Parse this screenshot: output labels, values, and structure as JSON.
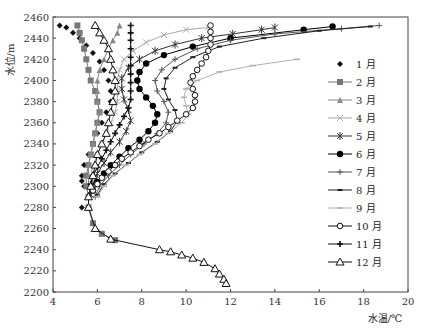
{
  "chart_data": {
    "type": "line",
    "title": "",
    "xlabel": "水温/℃",
    "ylabel": "水位/m",
    "xlim": [
      4,
      20
    ],
    "ylim": [
      2200,
      2460
    ],
    "xticks": [
      4,
      6,
      8,
      10,
      12,
      14,
      16,
      18,
      20
    ],
    "yticks": [
      2200,
      2220,
      2240,
      2260,
      2280,
      2300,
      2320,
      2340,
      2360,
      2380,
      2400,
      2420,
      2440,
      2460
    ],
    "grid": false,
    "legend_position": "right-inside",
    "series": [
      {
        "name": "1 月",
        "marker": "diamond-filled",
        "color": "#111111",
        "line": false,
        "points": [
          [
            4.3,
            2452
          ],
          [
            4.6,
            2450
          ],
          [
            4.9,
            2445
          ],
          [
            5.2,
            2440
          ],
          [
            5.5,
            2433
          ],
          [
            5.8,
            2426
          ],
          [
            6.1,
            2418
          ],
          [
            6.3,
            2410
          ],
          [
            6.5,
            2400
          ],
          [
            6.6,
            2390
          ],
          [
            6.6,
            2380
          ],
          [
            6.4,
            2370
          ],
          [
            6.2,
            2360
          ],
          [
            6.0,
            2350
          ],
          [
            5.8,
            2340
          ],
          [
            5.6,
            2330
          ],
          [
            5.4,
            2320
          ],
          [
            5.3,
            2310
          ],
          [
            5.3,
            2305
          ],
          [
            5.4,
            2300
          ],
          [
            5.3,
            2280
          ]
        ]
      },
      {
        "name": "2 月",
        "marker": "square-filled",
        "color": "#777777",
        "line": true,
        "points": [
          [
            5.1,
            2452
          ],
          [
            5.2,
            2445
          ],
          [
            5.3,
            2438
          ],
          [
            5.4,
            2430
          ],
          [
            5.5,
            2420
          ],
          [
            5.6,
            2410
          ],
          [
            5.7,
            2400
          ],
          [
            5.9,
            2390
          ],
          [
            6.0,
            2380
          ],
          [
            6.1,
            2370
          ],
          [
            6.0,
            2360
          ],
          [
            5.9,
            2350
          ],
          [
            5.8,
            2340
          ],
          [
            5.7,
            2330
          ],
          [
            5.6,
            2320
          ],
          [
            5.5,
            2310
          ],
          [
            5.5,
            2300
          ],
          [
            5.6,
            2290
          ],
          [
            5.6,
            2280
          ],
          [
            5.8,
            2265
          ],
          [
            6.2,
            2255
          ],
          [
            6.8,
            2249
          ]
        ]
      },
      {
        "name": "3 月",
        "marker": "triangle-filled",
        "color": "#888888",
        "line": true,
        "points": [
          [
            7.0,
            2452
          ],
          [
            6.9,
            2445
          ],
          [
            6.7,
            2438
          ],
          [
            6.5,
            2430
          ],
          [
            6.3,
            2420
          ],
          [
            6.1,
            2410
          ],
          [
            6.0,
            2400
          ],
          [
            6.0,
            2390
          ],
          [
            6.0,
            2380
          ],
          [
            6.1,
            2370
          ],
          [
            6.0,
            2360
          ],
          [
            5.9,
            2350
          ],
          [
            5.8,
            2340
          ],
          [
            5.7,
            2330
          ],
          [
            5.6,
            2320
          ],
          [
            5.6,
            2310
          ],
          [
            5.6,
            2300
          ]
        ]
      },
      {
        "name": "4 月",
        "marker": "x-cross",
        "color": "#aaaaaa",
        "line": true,
        "points": [
          [
            11.0,
            2450
          ],
          [
            10.0,
            2448
          ],
          [
            9.0,
            2443
          ],
          [
            8.2,
            2436
          ],
          [
            7.6,
            2428
          ],
          [
            7.2,
            2420
          ],
          [
            7.0,
            2410
          ],
          [
            6.9,
            2400
          ],
          [
            6.9,
            2390
          ],
          [
            6.9,
            2380
          ],
          [
            6.8,
            2370
          ],
          [
            6.6,
            2360
          ],
          [
            6.4,
            2350
          ],
          [
            6.2,
            2340
          ],
          [
            6.0,
            2330
          ],
          [
            5.8,
            2320
          ],
          [
            5.7,
            2310
          ],
          [
            5.7,
            2300
          ]
        ]
      },
      {
        "name": "5 月",
        "marker": "asterisk",
        "color": "#333333",
        "line": true,
        "points": [
          [
            14.0,
            2450
          ],
          [
            13.4,
            2448
          ],
          [
            12.1,
            2444
          ],
          [
            10.7,
            2440
          ],
          [
            9.5,
            2434
          ],
          [
            8.6,
            2428
          ],
          [
            7.9,
            2420
          ],
          [
            7.4,
            2412
          ],
          [
            7.1,
            2402
          ],
          [
            7.1,
            2392
          ],
          [
            7.2,
            2382
          ],
          [
            7.4,
            2372
          ],
          [
            7.5,
            2362
          ],
          [
            7.3,
            2352
          ],
          [
            7.0,
            2342
          ],
          [
            6.6,
            2332
          ],
          [
            6.3,
            2322
          ],
          [
            6.0,
            2312
          ],
          [
            5.8,
            2302
          ],
          [
            5.7,
            2292
          ]
        ]
      },
      {
        "name": "6 月",
        "marker": "circle-filled",
        "color": "#000000",
        "line": true,
        "points": [
          [
            16.6,
            2451
          ],
          [
            15.3,
            2448
          ],
          [
            12.0,
            2440
          ],
          [
            10.3,
            2432
          ],
          [
            9.0,
            2424
          ],
          [
            8.2,
            2416
          ],
          [
            7.9,
            2408
          ],
          [
            7.8,
            2400
          ],
          [
            7.9,
            2392
          ],
          [
            8.2,
            2384
          ],
          [
            8.5,
            2376
          ],
          [
            8.7,
            2368
          ],
          [
            8.6,
            2360
          ],
          [
            8.3,
            2352
          ],
          [
            7.9,
            2344
          ],
          [
            7.4,
            2336
          ],
          [
            7.0,
            2328
          ],
          [
            6.6,
            2320
          ],
          [
            6.3,
            2312
          ],
          [
            6.0,
            2304
          ],
          [
            5.8,
            2296
          ]
        ]
      },
      {
        "name": "7 月",
        "marker": "plus",
        "color": "#555555",
        "line": true,
        "points": [
          [
            18.7,
            2452
          ],
          [
            17.0,
            2449
          ],
          [
            14.0,
            2444
          ],
          [
            12.0,
            2438
          ],
          [
            10.5,
            2430
          ],
          [
            9.5,
            2420
          ],
          [
            8.9,
            2410
          ],
          [
            8.6,
            2400
          ],
          [
            8.7,
            2390
          ],
          [
            9.0,
            2380
          ],
          [
            9.2,
            2370
          ],
          [
            9.1,
            2360
          ],
          [
            8.7,
            2350
          ],
          [
            8.1,
            2340
          ],
          [
            7.5,
            2330
          ],
          [
            7.0,
            2320
          ],
          [
            6.5,
            2310
          ],
          [
            6.1,
            2300
          ],
          [
            5.9,
            2290
          ]
        ]
      },
      {
        "name": "8 月",
        "marker": "dash",
        "color": "#222222",
        "line": true,
        "points": [
          [
            18.3,
            2451
          ],
          [
            16.0,
            2447
          ],
          [
            13.5,
            2440
          ],
          [
            11.5,
            2432
          ],
          [
            10.3,
            2422
          ],
          [
            9.5,
            2412
          ],
          [
            9.1,
            2402
          ],
          [
            9.0,
            2392
          ],
          [
            9.2,
            2382
          ],
          [
            9.5,
            2372
          ],
          [
            9.6,
            2362
          ],
          [
            9.3,
            2352
          ],
          [
            8.7,
            2342
          ],
          [
            8.0,
            2332
          ],
          [
            7.4,
            2322
          ],
          [
            6.8,
            2312
          ],
          [
            6.3,
            2302
          ],
          [
            6.0,
            2292
          ]
        ]
      },
      {
        "name": "9 月",
        "marker": "dash-light",
        "color": "#b0b0b0",
        "line": true,
        "points": [
          [
            15.0,
            2420
          ],
          [
            13.0,
            2414
          ],
          [
            11.5,
            2408
          ],
          [
            10.5,
            2400
          ],
          [
            10.0,
            2392
          ],
          [
            9.9,
            2384
          ],
          [
            10.0,
            2376
          ],
          [
            10.1,
            2368
          ],
          [
            9.8,
            2360
          ],
          [
            9.2,
            2350
          ],
          [
            8.6,
            2340
          ],
          [
            7.9,
            2330
          ],
          [
            7.3,
            2320
          ],
          [
            6.7,
            2310
          ],
          [
            6.3,
            2300
          ],
          [
            6.0,
            2290
          ]
        ]
      },
      {
        "name": "10 月",
        "marker": "circle-open",
        "color": "#111111",
        "line": true,
        "points": [
          [
            11.1,
            2452
          ],
          [
            11.1,
            2446
          ],
          [
            11.1,
            2440
          ],
          [
            11.1,
            2434
          ],
          [
            11.0,
            2428
          ],
          [
            10.9,
            2422
          ],
          [
            10.7,
            2416
          ],
          [
            10.5,
            2410
          ],
          [
            10.3,
            2404
          ],
          [
            10.2,
            2398
          ],
          [
            10.3,
            2392
          ],
          [
            10.4,
            2386
          ],
          [
            10.4,
            2380
          ],
          [
            10.3,
            2374
          ],
          [
            10.0,
            2368
          ],
          [
            9.6,
            2362
          ],
          [
            9.2,
            2356
          ],
          [
            8.8,
            2350
          ],
          [
            8.3,
            2344
          ],
          [
            7.9,
            2338
          ],
          [
            7.5,
            2332
          ],
          [
            7.1,
            2326
          ],
          [
            6.8,
            2320
          ],
          [
            6.5,
            2314
          ],
          [
            6.2,
            2308
          ],
          [
            6.0,
            2302
          ],
          [
            5.8,
            2296
          ]
        ]
      },
      {
        "name": "11 月",
        "marker": "plus-bold",
        "color": "#111111",
        "line": true,
        "points": [
          [
            7.5,
            2452
          ],
          [
            7.5,
            2445
          ],
          [
            7.5,
            2438
          ],
          [
            7.5,
            2430
          ],
          [
            7.5,
            2422
          ],
          [
            7.5,
            2414
          ],
          [
            7.5,
            2406
          ],
          [
            7.5,
            2398
          ],
          [
            7.5,
            2390
          ],
          [
            7.5,
            2382
          ],
          [
            7.4,
            2374
          ],
          [
            7.2,
            2366
          ],
          [
            7.0,
            2358
          ],
          [
            6.8,
            2350
          ],
          [
            6.6,
            2342
          ],
          [
            6.4,
            2334
          ],
          [
            6.2,
            2326
          ],
          [
            6.0,
            2318
          ],
          [
            5.8,
            2310
          ],
          [
            5.7,
            2302
          ]
        ]
      },
      {
        "name": "12 月",
        "marker": "triangle-open",
        "color": "#111111",
        "line": true,
        "points": [
          [
            5.9,
            2452
          ],
          [
            6.1,
            2445
          ],
          [
            6.3,
            2438
          ],
          [
            6.5,
            2430
          ],
          [
            6.6,
            2420
          ],
          [
            6.7,
            2410
          ],
          [
            6.8,
            2400
          ],
          [
            6.8,
            2390
          ],
          [
            6.7,
            2380
          ],
          [
            6.6,
            2370
          ],
          [
            6.5,
            2360
          ],
          [
            6.4,
            2350
          ],
          [
            6.2,
            2340
          ],
          [
            6.0,
            2330
          ],
          [
            5.9,
            2320
          ],
          [
            5.8,
            2310
          ],
          [
            5.7,
            2300
          ],
          [
            5.6,
            2290
          ],
          [
            5.6,
            2280
          ],
          [
            5.9,
            2260
          ],
          [
            6.6,
            2250
          ],
          [
            8.8,
            2240
          ],
          [
            9.3,
            2238
          ],
          [
            9.8,
            2235
          ],
          [
            10.3,
            2232
          ],
          [
            10.8,
            2228
          ],
          [
            11.3,
            2222
          ],
          [
            11.5,
            2217
          ],
          [
            11.7,
            2212
          ],
          [
            11.8,
            2208
          ]
        ]
      }
    ]
  }
}
